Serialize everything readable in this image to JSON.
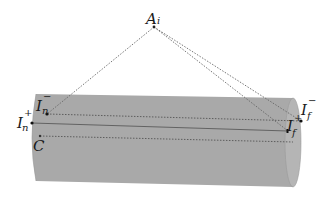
{
  "diagram": {
    "type": "geometric-illustration",
    "colors": {
      "background": "#ffffff",
      "cylinder_fill": "#a9a9a9",
      "cylinder_end": "#b8b8b8",
      "line": "#555555",
      "text": "#1a1a1a"
    },
    "points": {
      "apex": {
        "id": "A_i",
        "base": "A",
        "sub": "i",
        "x": 154,
        "y": 27
      },
      "near_minus": {
        "id": "I_n^-",
        "base": "I",
        "sub": "n",
        "sup": "−",
        "x": 47,
        "y": 114
      },
      "near_plus": {
        "id": "I_n^+",
        "base": "I",
        "sub": "n",
        "sup": "+",
        "x": 32,
        "y": 123
      },
      "center": {
        "id": "C",
        "base": "C",
        "x": 40,
        "y": 136
      },
      "far_minus": {
        "id": "I_f^-",
        "base": "I",
        "sub": "f",
        "sup": "−",
        "x": 301,
        "y": 121
      },
      "far_plus": {
        "id": "I_f^+",
        "base": "I",
        "sub": "f",
        "sup": "+",
        "x": 288,
        "y": 131
      }
    },
    "labels": {
      "A": "A",
      "A_sub": "i",
      "In_minus_base": "I",
      "In_minus_sub": "n",
      "In_minus_sup": "−",
      "In_plus_base": "I",
      "In_plus_sub": "n",
      "In_plus_sup": "+",
      "C": "C",
      "If_minus_base": "I",
      "If_minus_sub": "f",
      "If_minus_sup": "−",
      "If_plus_base": "I",
      "If_plus_sub": "f",
      "If_plus_sup": "+"
    },
    "edges": [
      {
        "from": "A_i",
        "to": "I_n^-",
        "style": "dotted"
      },
      {
        "from": "A_i",
        "to": "I_f^+",
        "style": "dotted"
      },
      {
        "from": "A_i",
        "to": "I_f^-",
        "style": "dotted"
      },
      {
        "from": "I_n^-",
        "to": "I_f^-",
        "style": "dotted"
      },
      {
        "from": "I_n^+",
        "to": "I_f^+",
        "style": "solid"
      },
      {
        "from": "C",
        "to": "far-end-center",
        "style": "dotted"
      }
    ]
  }
}
